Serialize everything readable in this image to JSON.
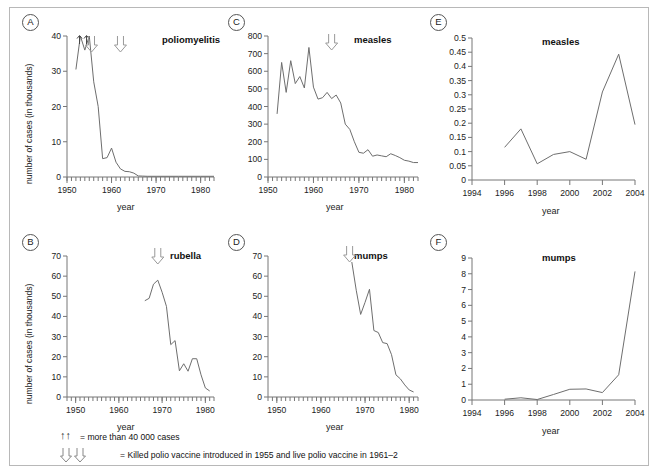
{
  "figure": {
    "xlabel": "year",
    "ylabel": "number of cases (in thousands)"
  },
  "legend": {
    "up_arrows_symbol": "↑↑",
    "up_arrows_text": "= more than 40 000 cases",
    "down_arrows_text": "= Killed polio vaccine introduced in 1955 and live polio vaccine in 1961–2"
  },
  "panels": [
    {
      "letter": "A",
      "title": "poliomyelitis"
    },
    {
      "letter": "B",
      "title": "rubella"
    },
    {
      "letter": "C",
      "title": "measles"
    },
    {
      "letter": "D",
      "title": "mumps"
    },
    {
      "letter": "E",
      "title": "measles"
    },
    {
      "letter": "F",
      "title": "mumps"
    }
  ],
  "chart_data": [
    {
      "panel": "A",
      "type": "line",
      "title": "poliomyelitis",
      "xlabel": "year",
      "ylabel": "number of cases (in thousands)",
      "xlim": [
        1950,
        1983
      ],
      "ylim": [
        0,
        40
      ],
      "xticks": [
        1950,
        1960,
        1970,
        1980
      ],
      "yticks": [
        0,
        10,
        20,
        30,
        40
      ],
      "grid": false,
      "annotations": [
        "↑↑ at 1953-1954 (more than 40 000 cases)",
        "⇓ at 1955 (killed polio vaccine)",
        "⇓ at 1961–2 (live polio vaccine)"
      ],
      "x": [
        1952,
        1953,
        1954,
        1955,
        1956,
        1957,
        1958,
        1959,
        1960,
        1961,
        1962,
        1963,
        1964,
        1965,
        1966,
        1967,
        1968,
        1970,
        1975,
        1980,
        1983
      ],
      "y": [
        30.5,
        40,
        36,
        40,
        27,
        20,
        5.2,
        5.5,
        8.2,
        4.2,
        2.3,
        1.6,
        1.5,
        1.1,
        0.3,
        0.25,
        0.2,
        0.2,
        0.2,
        0.2,
        0.2
      ]
    },
    {
      "panel": "B",
      "type": "line",
      "title": "rubella",
      "xlabel": "year",
      "ylabel": "number of cases (in thousands)",
      "xlim": [
        1948,
        1982
      ],
      "ylim": [
        0,
        70
      ],
      "xticks": [
        1950,
        1960,
        1970,
        1980
      ],
      "yticks": [
        0,
        10,
        20,
        30,
        40,
        50,
        60,
        70
      ],
      "grid": false,
      "annotations": [
        "⇓ at 1969 (rubella vaccine introduced)"
      ],
      "x": [
        1966,
        1967,
        1968,
        1969,
        1970,
        1971,
        1972,
        1973,
        1974,
        1975,
        1976,
        1977,
        1978,
        1979,
        1980,
        1981
      ],
      "y": [
        47.8,
        49,
        56,
        58,
        52,
        45,
        26,
        28,
        13,
        16.5,
        12.8,
        19,
        19,
        11,
        4.5,
        3
      ]
    },
    {
      "panel": "C",
      "type": "line",
      "title": "measles",
      "xlabel": "year",
      "ylabel": "number of cases (in thousands)",
      "xlim": [
        1950,
        1983
      ],
      "ylim": [
        0,
        800
      ],
      "xticks": [
        1950,
        1960,
        1970,
        1980
      ],
      "yticks": [
        0,
        100,
        200,
        300,
        400,
        500,
        600,
        700,
        800
      ],
      "grid": false,
      "annotations": [
        "⇓ at 1963 (measles vaccine introduced)"
      ],
      "x": [
        1952,
        1953,
        1954,
        1955,
        1956,
        1957,
        1958,
        1959,
        1960,
        1961,
        1962,
        1963,
        1964,
        1965,
        1966,
        1967,
        1968,
        1969,
        1970,
        1971,
        1972,
        1973,
        1974,
        1975,
        1976,
        1977,
        1978,
        1979,
        1980,
        1981,
        1982,
        1983
      ],
      "y": [
        358,
        650,
        480,
        660,
        530,
        570,
        505,
        735,
        510,
        442,
        450,
        480,
        445,
        465,
        420,
        300,
        270,
        200,
        140,
        135,
        155,
        118,
        125,
        120,
        115,
        132,
        122,
        110,
        95,
        90,
        82,
        82
      ]
    },
    {
      "panel": "D",
      "type": "line",
      "title": "mumps",
      "xlabel": "year",
      "ylabel": "number of cases (in thousands)",
      "xlim": [
        1948,
        1982
      ],
      "ylim": [
        0,
        70
      ],
      "xticks": [
        1950,
        1960,
        1970,
        1980
      ],
      "yticks": [
        0,
        10,
        20,
        30,
        40,
        50,
        60,
        70
      ],
      "grid": false,
      "annotations": [
        "⇓ at 1967 (mumps vaccine introduced)"
      ],
      "x": [
        1967,
        1968,
        1969,
        1970,
        1971,
        1972,
        1973,
        1974,
        1975,
        1976,
        1977,
        1978,
        1979,
        1980,
        1981
      ],
      "y": [
        67,
        53,
        41,
        47,
        53.5,
        33,
        32,
        27,
        26.5,
        21,
        11,
        9,
        6,
        3.5,
        2.5
      ]
    },
    {
      "panel": "E",
      "type": "line",
      "title": "measles",
      "xlabel": "year",
      "ylabel": "",
      "xlim": [
        1994,
        2004
      ],
      "ylim": [
        0,
        0.5
      ],
      "xticks": [
        1994,
        1996,
        1998,
        2000,
        2002,
        2004
      ],
      "yticks": [
        0,
        0.05,
        0.1,
        0.15,
        0.2,
        0.25,
        0.3,
        0.35,
        0.4,
        0.45,
        0.5
      ],
      "grid": false,
      "x": [
        1996,
        1997,
        1998,
        1999,
        2000,
        2001,
        2002,
        2003,
        2004
      ],
      "y": [
        0.115,
        0.18,
        0.057,
        0.09,
        0.1,
        0.073,
        0.31,
        0.443,
        0.195
      ]
    },
    {
      "panel": "F",
      "type": "line",
      "title": "mumps",
      "xlabel": "year",
      "ylabel": "",
      "xlim": [
        1994,
        2004
      ],
      "ylim": [
        0,
        9
      ],
      "xticks": [
        1994,
        1996,
        1998,
        2000,
        2002,
        2004
      ],
      "yticks": [
        0,
        1,
        2,
        3,
        4,
        5,
        6,
        7,
        8,
        9
      ],
      "grid": false,
      "x": [
        1996,
        1997,
        1998,
        1999,
        2000,
        2001,
        2002,
        2003,
        2004
      ],
      "y": [
        0.05,
        0.14,
        0.03,
        0.35,
        0.68,
        0.7,
        0.47,
        1.6,
        8.15
      ]
    }
  ]
}
